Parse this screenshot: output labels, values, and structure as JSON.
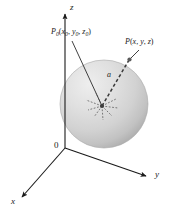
{
  "figure": {
    "background_color": "#ffffff",
    "line_color": "#1a1a1a",
    "sphere": {
      "fill_light": "#e8e8e8",
      "fill_mid": "#cfcfcf",
      "fill_dark": "#b4b4b4",
      "edge_color": "#9a9a9a",
      "center_x": 104,
      "center_y": 104,
      "radius_px": 44
    }
  },
  "axes": {
    "z_label": "z",
    "y_label": "y",
    "x_label": "x",
    "origin_label": "0"
  },
  "labels": {
    "center_point": {
      "name": "P",
      "subscript": "0",
      "open": "(",
      "x": "x",
      "x_sub": "0",
      "comma1": ", ",
      "y": "y",
      "y_sub": "0",
      "comma2": ", ",
      "z": "z",
      "z_sub": "0",
      "close": ")",
      "full_text": "P0(x0, y0, z0)"
    },
    "surface_point": {
      "name": "P",
      "open": "(",
      "x": "x",
      "comma1": ", ",
      "y": "y",
      "comma2": ", ",
      "z": "z",
      "close": ")",
      "full_text": "P(x, y, z)"
    },
    "radius": "a"
  }
}
